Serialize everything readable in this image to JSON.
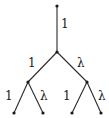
{
  "diagram": {
    "type": "binary-tree",
    "nodes": [
      {
        "id": "root",
        "x": 57,
        "y": 6
      },
      {
        "id": "n1",
        "x": 57,
        "y": 52
      },
      {
        "id": "n2",
        "x": 28,
        "y": 82
      },
      {
        "id": "n3",
        "x": 87,
        "y": 82
      },
      {
        "id": "leaf1",
        "x": 14,
        "y": 113
      },
      {
        "id": "leaf2",
        "x": 43,
        "y": 113
      },
      {
        "id": "leaf3",
        "x": 72,
        "y": 113
      },
      {
        "id": "leaf4",
        "x": 101,
        "y": 113
      }
    ],
    "edges": [
      {
        "from": "root",
        "to": "n1",
        "label": "1",
        "label_x": 61,
        "label_y": 28
      },
      {
        "from": "n1",
        "to": "n2",
        "label": "1",
        "label_x": 28,
        "label_y": 67
      },
      {
        "from": "n1",
        "to": "n3",
        "label": "λ",
        "label_x": 77,
        "label_y": 67
      },
      {
        "from": "n2",
        "to": "leaf1",
        "label": "1",
        "label_x": 5,
        "label_y": 100
      },
      {
        "from": "n2",
        "to": "leaf2",
        "label": "λ",
        "label_x": 40,
        "label_y": 100
      },
      {
        "from": "n3",
        "to": "leaf3",
        "label": "1",
        "label_x": 63,
        "label_y": 100
      },
      {
        "from": "n3",
        "to": "leaf4",
        "label": "λ",
        "label_x": 98,
        "label_y": 100
      }
    ]
  }
}
